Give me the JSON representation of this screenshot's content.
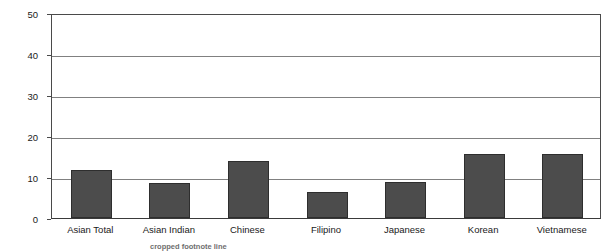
{
  "chart_data": {
    "type": "bar",
    "title": "",
    "xlabel": "",
    "ylabel": "Percent below poverty",
    "ylim": [
      0,
      50
    ],
    "yticks": [
      0,
      10,
      20,
      30,
      40,
      50
    ],
    "grid": true,
    "legend": false,
    "bar_color": "#4c4c4c",
    "categories": [
      "Asian Total",
      "Asian Indian",
      "Chinese",
      "Filipino",
      "Japanese",
      "Korean",
      "Vietnamese"
    ],
    "values": [
      11.8,
      8.5,
      13.8,
      6.3,
      8.8,
      15.6,
      15.5
    ]
  },
  "axes": {
    "y_title": "Percent below poverty",
    "y_tick_labels": [
      "50",
      "40",
      "30",
      "20",
      "10",
      "0"
    ]
  },
  "caption": {
    "text": "cropped footnote line"
  }
}
